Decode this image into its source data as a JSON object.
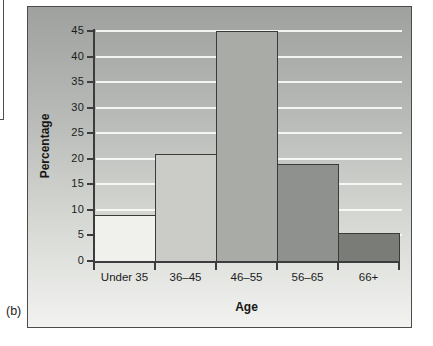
{
  "figure": {
    "panel_label": "(b)"
  },
  "chart_data": {
    "type": "bar",
    "title": "",
    "xlabel": "Age",
    "ylabel": "Percentage",
    "categories": [
      "Under 35",
      "36–45",
      "46–55",
      "56–65",
      "66+"
    ],
    "values": [
      9,
      21,
      45,
      19,
      5.5
    ],
    "ylim": [
      0,
      45
    ],
    "yticks": [
      0,
      5,
      10,
      15,
      20,
      25,
      30,
      35,
      40,
      45
    ],
    "grid": "horizontal white gridlines",
    "legend": "none",
    "bars_adjacent": true,
    "colors": {
      "bar_fills": [
        "#f0f1ed",
        "#cbccc8",
        "#a9aba7",
        "#8f918e",
        "#7a7c78"
      ],
      "bar_border": "#3a3a3a",
      "axis": "#3c3c3c",
      "gridline": "#fbfbf9",
      "background_gradient_top": "#9ea19e",
      "background_gradient_bottom": "#f2f3f0",
      "frame_border": "#4b4b4b",
      "text": "#1c1c1c"
    }
  }
}
